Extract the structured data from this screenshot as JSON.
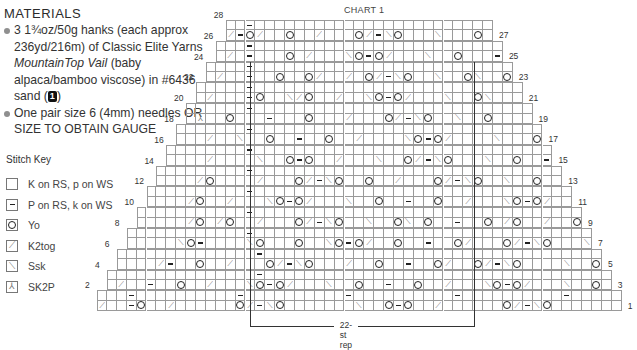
{
  "materials": {
    "title": "MATERIALS",
    "items": [
      {
        "text_parts": [
          "3 1¾oz/50g hanks (each approx 236yd/216m) of Classic Elite Yarns ",
          "MountainTop Vail",
          " (baby alpaca/bamboo viscose) in #6436 sand (",
          "1",
          ")"
        ]
      },
      {
        "text_parts": [
          "One pair size 6 (4mm) needles OR SIZE TO OBTAIN GAUGE"
        ]
      }
    ]
  },
  "stitch_key": {
    "title": "Stitch Key",
    "items": [
      {
        "symbol": "knit-box-icon",
        "glyph": "",
        "label": "K on RS, p on WS"
      },
      {
        "symbol": "purl-dash-icon",
        "glyph": "–",
        "label": "P on RS, k on WS"
      },
      {
        "symbol": "yarn-over-circle-icon",
        "glyph": "O",
        "label": "Yo"
      },
      {
        "symbol": "k2tog-slash-icon",
        "glyph": "⟋",
        "label": "K2tog"
      },
      {
        "symbol": "ssk-backslash-icon",
        "glyph": "⟍",
        "label": "Ssk"
      },
      {
        "symbol": "sk2p-arrow-icon",
        "glyph": "⅄",
        "label": "SK2P"
      }
    ]
  },
  "chart": {
    "title": "CHART 1",
    "origin_x": 97,
    "origin_y": 20,
    "cell_w": 9.9,
    "cell_h": 10.4,
    "total_cols": 53,
    "legend_codes": {
      ".": "knit",
      "-": "purl",
      "o": "yo",
      "/": "k2tog",
      "\\": "ssk",
      "^": "sk2p"
    },
    "rows": [
      {
        "n": 28,
        "cells": "..-........................"
      },
      {
        "n": 27,
        "cells": "/-o/..o../...o/-\\o...\\...o..\\o-\\"
      },
      {
        "n": 26,
        "cells": "...-..........................."
      },
      {
        "n": 25,
        "cells": "./.-...o./...\\o-o/...\\..o...-.\\"
      },
      {
        "n": 24,
        "cells": "....-.............................."
      },
      {
        "n": 23,
        "cells": "./..-..o..o/../.o/-\\o..\\..o\\..o..-..\\"
      },
      {
        "n": 22,
        "cells": ".....-................................."
      },
      {
        "n": 21,
        "cells": "./...-o..\\/o../..\\o-o/...\\..o\\...o-...\\"
      },
      {
        "n": 20,
        "cells": "......-....................................."
      },
      {
        "n": 19,
        "cells": ".^..o...-...o.../...o/-\\o..\\..o.....-...o.^"
      },
      {
        "n": 18,
        "cells": ".......-........................................"
      },
      {
        "n": 17,
        "cells": ".../..\\..o..-..o../....\\o-o/....\\...o...../..\\"
      },
      {
        "n": 16,
        "cells": "........-..........................................."
      },
      {
        "n": 15,
        "cells": "..../....\\..o-o../...\\..o/-\\o...\\..o..-./.....\\"
      },
      {
        "n": 14,
        "cells": ".........-.............................................."
      },
      {
        "n": 13,
        "cells": "..../o..../...o/-\\o..o../...o/-\\o..\\..o..\\o....\\.o\\"
      },
      {
        "n": 12,
        "cells": "..........-................................................."
      },
      {
        "n": 11,
        "cells": "..../o../...\\o-o/...\\..o..-..o../...\\o-o/..\\..o\\....\\"
      },
      {
        "n": 10,
        "cells": "...........-...................................................."
      },
      {
        "n": 9,
        "cells": "...../o./o../...o/-\\o..\\..o\\.o..-..o./o../..o/-\\o.\\..o\\..o\\"
      },
      {
        "n": 8,
        "cells": "............-......................................................"
      },
      {
        "n": 7,
        "cells": ".....\\o-....\\o...o..\\o-o/..o..-..o/...o/-\\o...\\..o.../..o\\"
      },
      {
        "n": 6,
        "cells": "..............-........................................................."
      },
      {
        "n": 5,
        "cells": "..../-..o../...o/-\\o.../..o..-..o/..o/-\\o....\\..o...-\\"
      },
      {
        "n": 4,
        "cells": "...............-..........................................................."
      },
      {
        "n": 3,
        "cells": "./..-..o../...\\o-o/...\\..o..-..o../...\\o-o/...\\..o...-..\\"
      },
      {
        "n": 2,
        "cells": "...-..........-..........-..........-..........-....."
      },
      {
        "n": 1,
        "cells": "/..-o../......o/-\\o.......\\..o-o../......o/-\\o.......\\..o-...\\"
      }
    ],
    "rep_label": "22-st rep",
    "rep_start_col": 15.5,
    "rep_end_col": 38
  }
}
